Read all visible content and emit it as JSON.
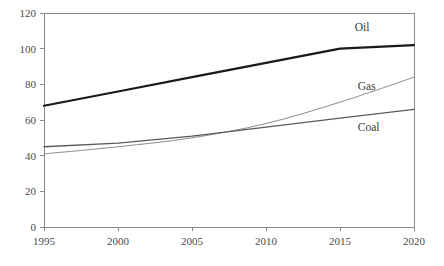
{
  "chart_data": {
    "type": "line",
    "title": "",
    "subtitle": "",
    "xlabel": "",
    "ylabel": "",
    "x": [
      1995,
      2000,
      2005,
      2010,
      2015,
      2020
    ],
    "xtick_labels": [
      "1995",
      "2000",
      "2005",
      "2010",
      "2015",
      "2020"
    ],
    "ytick_labels": [
      "0",
      "20",
      "40",
      "60",
      "80",
      "100",
      "120"
    ],
    "yticks": [
      0,
      20,
      40,
      60,
      80,
      100,
      120
    ],
    "xlim": [
      1995,
      2020
    ],
    "ylim": [
      0,
      120
    ],
    "grid": false,
    "legend_position": "inline-labels",
    "series": [
      {
        "name": "Oil",
        "label": "Oil",
        "color": "#1a1a1a",
        "width": 2.2,
        "values": [
          68,
          76,
          84,
          92,
          100,
          102
        ]
      },
      {
        "name": "Gas",
        "label": "Gas",
        "color": "#8c8c8c",
        "width": 1.0,
        "values": [
          41,
          45,
          50,
          58,
          70,
          84
        ]
      },
      {
        "name": "Coal",
        "label": "Coal",
        "color": "#5a5a5a",
        "width": 1.3,
        "values": [
          45,
          47,
          51,
          56,
          61,
          66
        ]
      }
    ],
    "annotations": [
      {
        "text": "Oil",
        "x": 2016.0,
        "y": 110
      },
      {
        "text": "Gas",
        "x": 2016.2,
        "y": 77
      },
      {
        "text": "Coal",
        "x": 2016.2,
        "y": 54
      }
    ]
  },
  "figure": {
    "background_color": "#ffffff",
    "axis_color": "#8a8a8a",
    "text_color": "#4a4a4a"
  }
}
